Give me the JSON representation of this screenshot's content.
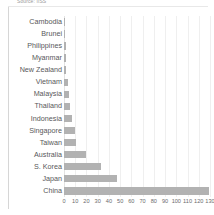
{
  "source_note": "Source: IISS",
  "chart_data": {
    "type": "bar",
    "orientation": "horizontal",
    "title": "",
    "subtitle": "",
    "xlabel": "",
    "ylabel": "",
    "xlim": [
      0,
      130
    ],
    "grid": true,
    "legend": false,
    "bar_color": "#b2b2b2",
    "xticks": [
      0,
      10,
      20,
      30,
      40,
      50,
      60,
      70,
      80,
      90,
      100,
      110,
      120,
      130
    ],
    "categories": [
      "Cambodia",
      "Brunei",
      "Philippines",
      "Myanmar",
      "New Zealand",
      "Vietnam",
      "Malaysia",
      "Thailand",
      "Indonesia",
      "Singapore",
      "Taiwan",
      "Australia",
      "S. Korea",
      "Japan",
      "China"
    ],
    "values": [
      0.3,
      0.4,
      1.5,
      2.0,
      2.2,
      3.5,
      4.5,
      5.5,
      7.0,
      10.0,
      10.5,
      20.0,
      33.0,
      47.0,
      129.0
    ]
  }
}
